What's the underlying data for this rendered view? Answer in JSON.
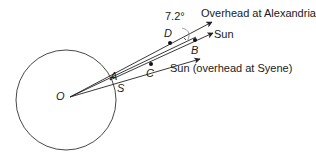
{
  "diagram": {
    "angle_label": "7.2°",
    "points": {
      "O": "O",
      "A": "A",
      "S": "S",
      "C": "C",
      "D": "D",
      "B": "B"
    },
    "rays": [
      {
        "label": "Overhead at Alexandria"
      },
      {
        "label": "Sun"
      },
      {
        "label": "Sun (overhead at Syene)"
      }
    ],
    "colors": {
      "stroke": "#222222",
      "background": "#ffffff"
    }
  }
}
